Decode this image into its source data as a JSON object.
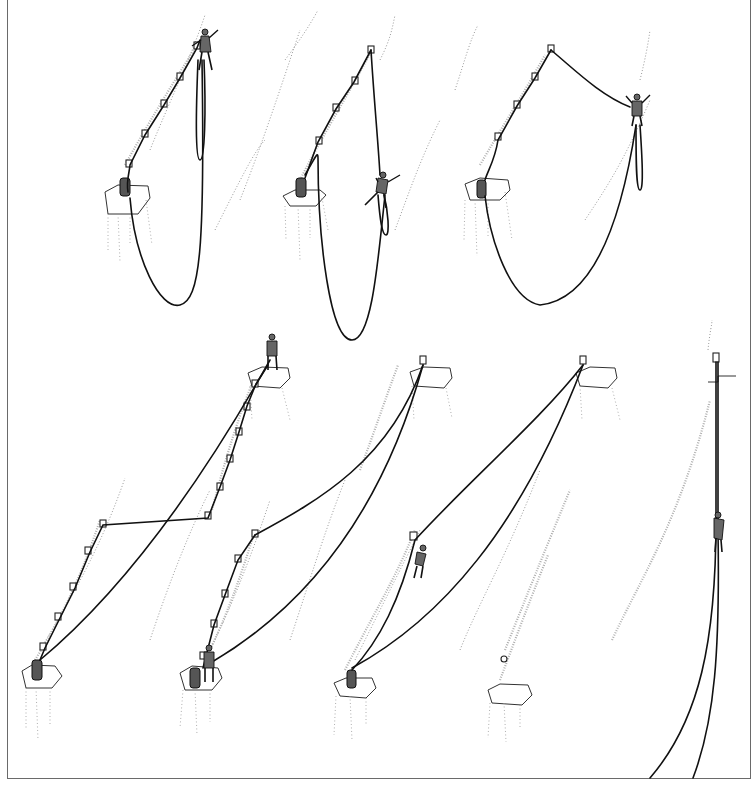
{
  "figure": {
    "caption_fragment": "",
    "caption_note": "Top caption line is cropped; only descenders visible",
    "colors": {
      "ink": "#111111",
      "rock_stipple": "#9a9a9a",
      "frame": "#6a6a6a",
      "background": "#ffffff"
    }
  },
  "panels": [
    {
      "id": 1,
      "row": "top",
      "depicts": "lead climber on protection above, belayer with pack on ledge, rope loop hanging"
    },
    {
      "id": 2,
      "row": "top",
      "depicts": "climber pendulum swing from top piece"
    },
    {
      "id": 3,
      "row": "top",
      "depicts": "climber reaching across traverse, long rope loop"
    },
    {
      "id": 4,
      "row": "bottom",
      "depicts": "climber at upper ledge, rope traversing back through protection"
    },
    {
      "id": 5,
      "row": "bottom",
      "depicts": "second at lower ledge with pack, double rope to upper anchor"
    },
    {
      "id": 6,
      "row": "bottom",
      "depicts": "second climbing rope toward upper anchor, pack left on ledge"
    },
    {
      "id": 7,
      "row": "bottom",
      "depicts": "climber ascending single fixed rope under upper anchor"
    }
  ]
}
